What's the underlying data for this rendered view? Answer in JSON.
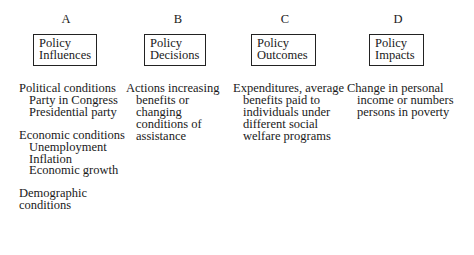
{
  "columns": [
    {
      "letter": "A",
      "box": [
        "Policy",
        "Influences"
      ],
      "groups": [
        {
          "head": "Political conditions",
          "items": [
            "Party in Congress",
            "Presidential party"
          ]
        },
        {
          "head": "Economic conditions",
          "items": [
            "Unemployment",
            "Inflation",
            "Economic growth"
          ]
        },
        {
          "head": "Demographic",
          "items": [],
          "tail": "conditions"
        }
      ]
    },
    {
      "letter": "B",
      "box": [
        "Policy",
        "Decisions"
      ],
      "lines": [
        "Actions increasing",
        "benefits or",
        "changing",
        "conditions of",
        "assistance"
      ]
    },
    {
      "letter": "C",
      "box": [
        "Policy",
        "Outcomes"
      ],
      "lines": [
        "Expenditures, average",
        "benefits paid to",
        "individuals under",
        "different social",
        "welfare programs"
      ]
    },
    {
      "letter": "D",
      "box": [
        "Policy",
        "Impacts"
      ],
      "lines": [
        "Change in personal",
        "income or numbers",
        "persons in poverty"
      ]
    }
  ]
}
